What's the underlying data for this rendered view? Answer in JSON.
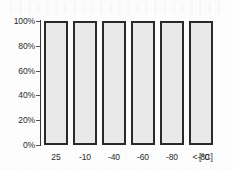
{
  "chart_data": {
    "type": "bar",
    "title": "",
    "subtitle": "",
    "xlabel": "",
    "ylabel": "",
    "unit_label": "[°C]",
    "categories": [
      "25",
      "-10",
      "-40",
      "-60",
      "-80",
      "<-80"
    ],
    "values": [
      100,
      100,
      100,
      100,
      100,
      100
    ],
    "ylim": [
      0,
      100
    ],
    "ytick_labels": [
      "100%",
      "80%",
      "60%",
      "40%",
      "20%",
      "0%"
    ],
    "ytick_values": [
      100,
      80,
      60,
      40,
      20,
      0
    ],
    "grid": false,
    "legend": null,
    "legend_position": "none",
    "series": [
      {
        "name": "",
        "values": [
          100,
          100,
          100,
          100,
          100,
          100
        ]
      }
    ]
  },
  "style": {
    "bar_fill": "#e9e9e9",
    "bar_border": "#2a2a2a",
    "axis_color": "#3a3a3a",
    "text_color": "#2b2b2b",
    "background": "#fdfdfd"
  }
}
